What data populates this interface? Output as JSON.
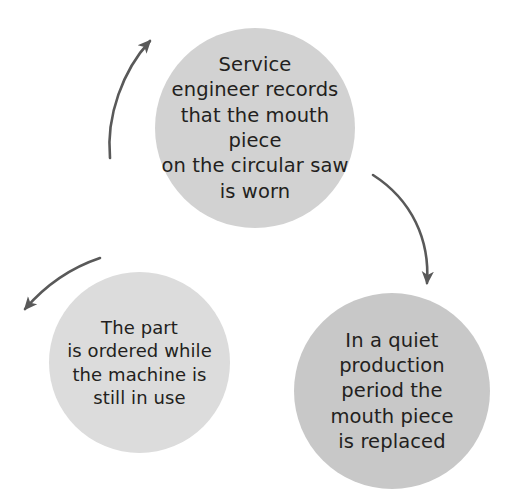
{
  "diagram": {
    "type": "cycle",
    "background_color": "#ffffff",
    "arrow_color": "#595959",
    "nodes": [
      {
        "id": "record",
        "name": "service-engineer-records-step",
        "text": "Service\nengineer records\nthat the mouth piece\non the circular saw\nis worn",
        "fill_color": "#d2d2d2",
        "text_color": "#231f20"
      },
      {
        "id": "replace",
        "name": "mouth-piece-replaced-step",
        "text": "In a quiet\nproduction\nperiod the\nmouth piece\nis replaced",
        "fill_color": "#c8c8c8",
        "text_color": "#231f20"
      },
      {
        "id": "order",
        "name": "part-ordered-step",
        "text": "The part\nis ordered while\nthe machine is\nstill in use",
        "fill_color": "#dcdcdc",
        "text_color": "#231f20"
      }
    ],
    "arrows": [
      {
        "id": "order-to-record",
        "label": "",
        "from": "order",
        "to": "record"
      },
      {
        "id": "record-to-replace",
        "label": "",
        "from": "record",
        "to": "replace"
      },
      {
        "id": "replace-to-order",
        "label": "",
        "from": "replace",
        "to": "order"
      }
    ]
  }
}
